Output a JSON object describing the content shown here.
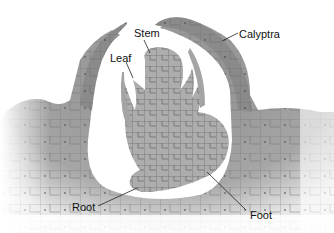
{
  "diagram": {
    "labels": {
      "stem": "Stem",
      "leaf": "Leaf",
      "calyptra": "Calyptra",
      "root": "Root",
      "foot": "Foot"
    },
    "colors": {
      "tissue_dark": "#8a8a8a",
      "tissue_light": "#b4b4b4",
      "embryo": "#a9a9a9",
      "cell_wall": "#5a5a5a",
      "background": "#ffffff",
      "label_text": "#111111"
    }
  }
}
